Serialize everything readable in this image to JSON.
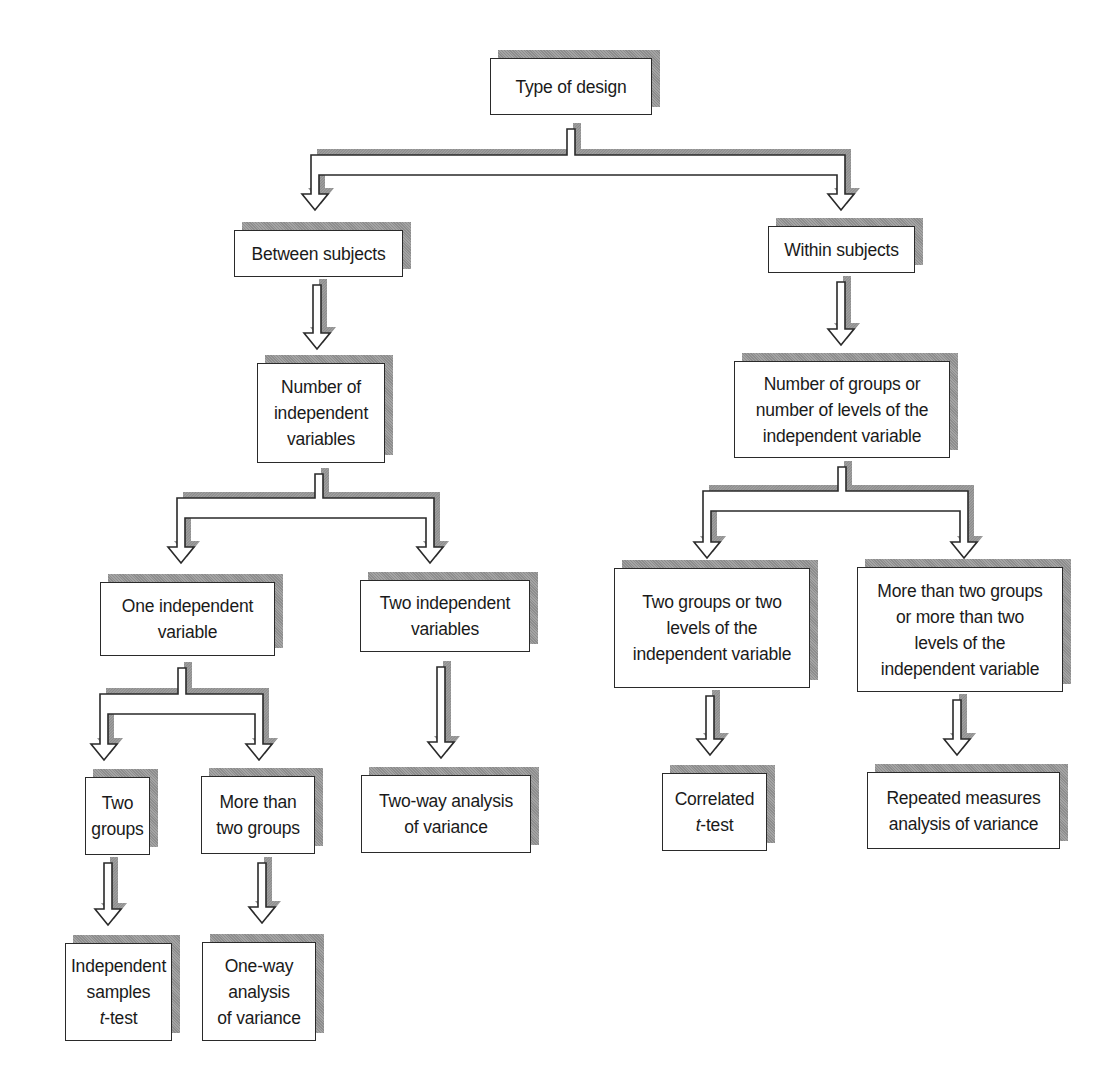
{
  "diagram": {
    "title": "Type of design",
    "nodes": {
      "root": {
        "lines": [
          "Type of design"
        ]
      },
      "between": {
        "lines": [
          "Between subjects"
        ]
      },
      "within": {
        "lines": [
          "Within subjects"
        ]
      },
      "num_iv": {
        "lines": [
          "Number of",
          "independent",
          "variables"
        ]
      },
      "num_groups": {
        "lines": [
          "Number of groups or",
          "number of levels of the",
          "independent variable"
        ]
      },
      "one_iv": {
        "lines": [
          "One independent",
          "variable"
        ]
      },
      "two_iv": {
        "lines": [
          "Two independent",
          "variables"
        ]
      },
      "two_groups_levels": {
        "lines": [
          "Two groups or two",
          "levels of the",
          "independent variable"
        ]
      },
      "more_groups_levels": {
        "lines": [
          "More than two groups",
          "or more than two",
          "levels of the",
          "independent variable"
        ]
      },
      "two_groups": {
        "lines": [
          "Two",
          "groups"
        ]
      },
      "more_groups": {
        "lines": [
          "More than",
          "two groups"
        ]
      },
      "two_way_anova": {
        "lines": [
          "Two-way analysis",
          "of variance"
        ]
      },
      "correlated_t": {
        "italic": "t",
        "lines": [
          "Correlated",
          "-test"
        ]
      },
      "repeated_anova": {
        "lines": [
          "Repeated measures",
          "analysis of variance"
        ]
      },
      "indep_t": {
        "italic": "t",
        "lines": [
          "Independent",
          "samples",
          "-test"
        ]
      },
      "one_way_anova": {
        "lines": [
          "One-way",
          "analysis",
          "of variance"
        ]
      }
    },
    "edges": [
      [
        "root",
        "between"
      ],
      [
        "root",
        "within"
      ],
      [
        "between",
        "num_iv"
      ],
      [
        "within",
        "num_groups"
      ],
      [
        "num_iv",
        "one_iv"
      ],
      [
        "num_iv",
        "two_iv"
      ],
      [
        "num_groups",
        "two_groups_levels"
      ],
      [
        "num_groups",
        "more_groups_levels"
      ],
      [
        "one_iv",
        "two_groups"
      ],
      [
        "one_iv",
        "more_groups"
      ],
      [
        "two_iv",
        "two_way_anova"
      ],
      [
        "two_groups_levels",
        "correlated_t"
      ],
      [
        "more_groups_levels",
        "repeated_anova"
      ],
      [
        "two_groups",
        "indep_t"
      ],
      [
        "more_groups",
        "one_way_anova"
      ]
    ],
    "colors": {
      "line": "#2a2a2a",
      "shadow": "#9a9a9a",
      "background": "#ffffff"
    }
  }
}
